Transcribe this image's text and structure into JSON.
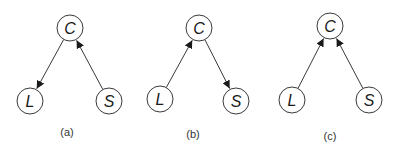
{
  "diagram": {
    "node_radius": 13,
    "colors": {
      "stroke": "#3a3a3a",
      "text": "#1a1a1a",
      "background": "#ffffff"
    },
    "panels": [
      {
        "id": "a",
        "caption": "(a)",
        "caption_pos": [
          67,
          136
        ],
        "nodes": [
          {
            "id": "C",
            "label": "C",
            "x": 70,
            "y": 28
          },
          {
            "id": "L",
            "label": "L",
            "x": 30,
            "y": 101
          },
          {
            "id": "S",
            "label": "S",
            "x": 109,
            "y": 101
          }
        ],
        "edges": [
          {
            "from": "C",
            "to": "L"
          },
          {
            "from": "S",
            "to": "C"
          }
        ]
      },
      {
        "id": "b",
        "caption": "(b)",
        "caption_pos": [
          193,
          138
        ],
        "nodes": [
          {
            "id": "C",
            "label": "C",
            "x": 199,
            "y": 28
          },
          {
            "id": "L",
            "label": "L",
            "x": 160,
            "y": 99
          },
          {
            "id": "S",
            "label": "S",
            "x": 236,
            "y": 101
          }
        ],
        "edges": [
          {
            "from": "L",
            "to": "C"
          },
          {
            "from": "C",
            "to": "S"
          }
        ]
      },
      {
        "id": "c",
        "caption": "(c)",
        "caption_pos": [
          330,
          140
        ],
        "nodes": [
          {
            "id": "C",
            "label": "C",
            "x": 330,
            "y": 26
          },
          {
            "id": "L",
            "label": "L",
            "x": 292,
            "y": 100
          },
          {
            "id": "S",
            "label": "S",
            "x": 369,
            "y": 100
          }
        ],
        "edges": [
          {
            "from": "L",
            "to": "C"
          },
          {
            "from": "S",
            "to": "C"
          }
        ]
      }
    ]
  }
}
